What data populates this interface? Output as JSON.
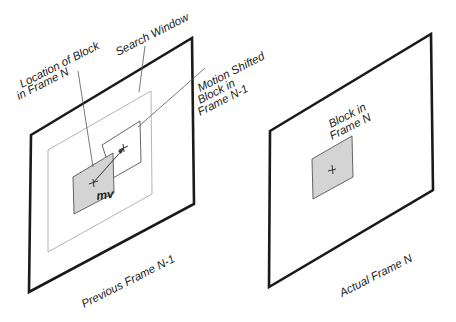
{
  "labels": {
    "location_block_line1": "Location of Block",
    "location_block_line2": "in Frame N",
    "search_window": "Search Window",
    "motion_shifted_line1": "Motion Shifted",
    "motion_shifted_line2": "Block in",
    "motion_shifted_line3": "Frame N-1",
    "mv": "mv",
    "block_in_line1": "Block in",
    "block_in_line2": "Frame N",
    "previous_frame": "Previous Frame N-1",
    "actual_frame": "Actual Frame N"
  },
  "colors": {
    "frame_stroke": "#1a1a1a",
    "search_window_stroke": "#b5b5b5",
    "block_fill": "#d4d4d4",
    "leader_line": "#555555"
  }
}
